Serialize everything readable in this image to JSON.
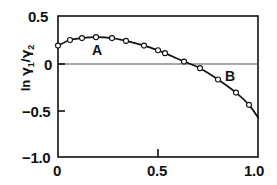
{
  "chart_data": {
    "type": "scatter",
    "title": "",
    "subtitle": "",
    "xlabel": "",
    "ylabel": "ln γ₁/γ₂",
    "ylabel_parts": {
      "prefix": "ln ",
      "num_symbol": "γ",
      "num_sub": "1",
      "separator": "/",
      "den_symbol": "γ",
      "den_sub": "2"
    },
    "xlim": [
      0.0,
      1.0
    ],
    "ylim": [
      -1.0,
      0.5
    ],
    "xticks": [
      0.0,
      0.5,
      1.0
    ],
    "xtick_labels": [
      "0",
      "0.5",
      "1.0"
    ],
    "yticks": [
      0.5,
      0.0,
      -0.5,
      -1.0
    ],
    "ytick_labels": [
      "0.5",
      "0",
      "−0.5",
      "−1.0"
    ],
    "grid": false,
    "zero_line": true,
    "legend": "none",
    "marker": "open-circle",
    "line_color": "#111111",
    "marker_edge_color": "#111111",
    "marker_face_color": "#ffffff",
    "series": [
      {
        "name": "ln gamma1/gamma2 vs x1",
        "x": [
          0.0,
          0.06,
          0.12,
          0.19,
          0.27,
          0.34,
          0.43,
          0.5,
          0.535,
          0.63,
          0.71,
          0.8,
          0.89,
          0.955,
          1.0
        ],
        "y": [
          0.185,
          0.245,
          0.265,
          0.275,
          0.265,
          0.235,
          0.185,
          0.135,
          0.105,
          0.015,
          -0.055,
          -0.175,
          -0.315,
          -0.445,
          -0.58
        ]
      }
    ],
    "annotations": [
      {
        "text": "A",
        "x": 0.27,
        "y": 0.11,
        "name": "region-label-a"
      },
      {
        "text": "B",
        "x": 0.82,
        "y": -0.06,
        "name": "region-label-b"
      }
    ],
    "zero_crossing_x": 0.645,
    "peak": {
      "x": 0.19,
      "y": 0.275
    }
  }
}
